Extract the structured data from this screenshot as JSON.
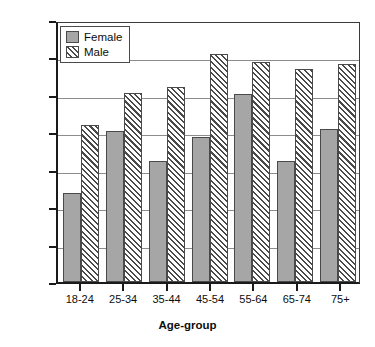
{
  "chart_data": {
    "type": "bar",
    "title": "",
    "xlabel": "Age-group",
    "ylabel": "Percent",
    "categories": [
      "18-24",
      "25-34",
      "35-44",
      "45-54",
      "55-64",
      "65-74",
      "75+"
    ],
    "series": [
      {
        "name": "Female",
        "values": [
          11.9,
          20.2,
          16.1,
          19.4,
          25.1,
          16.2,
          20.4
        ],
        "color": "#a6a6a6",
        "fill": "solid-gray"
      },
      {
        "name": "Male",
        "values": [
          21.0,
          25.2,
          26.0,
          30.4,
          29.4,
          28.4,
          29.1
        ],
        "color": "#ffffff",
        "fill": "diagonal-hatch"
      }
    ],
    "ylim": [
      0,
      35
    ],
    "yticks": [
      0,
      5,
      10,
      15,
      20,
      25,
      30,
      35
    ],
    "ytick_labels": [
      "0",
      "5",
      "10",
      "15",
      "20",
      "25",
      "30",
      "35"
    ],
    "grid": true,
    "grid_axis": "y",
    "legend_position": "top-left",
    "legend_entries": [
      "Female",
      "Male"
    ]
  }
}
